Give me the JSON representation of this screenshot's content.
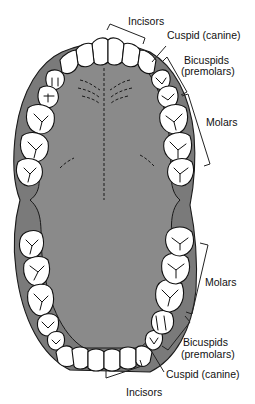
{
  "diagram": {
    "upper_arch": {
      "labels": {
        "incisors": "Incisors",
        "cuspid": "Cuspid (canine)",
        "bicuspids_line1": "Bicuspids",
        "bicuspids_line2": "(premolars)",
        "molars": "Molars"
      }
    },
    "lower_arch": {
      "labels": {
        "molars": "Molars",
        "bicuspids_line1": "Bicuspids",
        "bicuspids_line2": "(premolars)",
        "cuspid": "Cuspid (canine)",
        "incisors": "Incisors"
      }
    },
    "colors": {
      "gum": "#7a7a7a",
      "palate": "#8a8a8a",
      "tooth": "#ffffff",
      "outline": "#111111"
    }
  }
}
